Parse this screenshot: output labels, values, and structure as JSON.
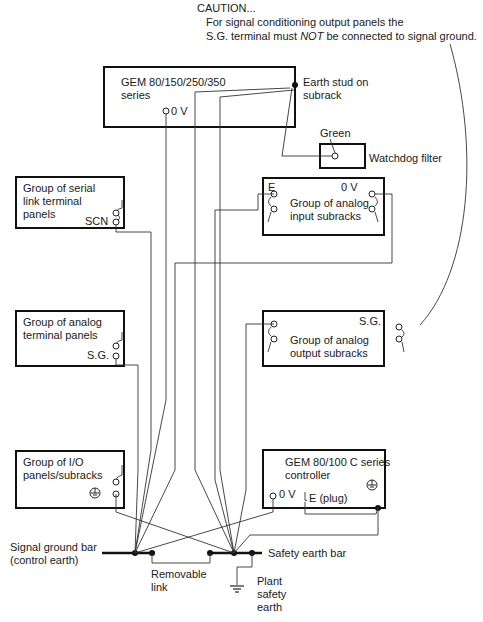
{
  "caution": {
    "title": "CAUTION...",
    "line1": "For signal conditioning output panels the",
    "line2_a": "S.G. terminal must ",
    "line2_em": "NOT",
    "line2_b": " be connected to signal ground."
  },
  "gem_series": {
    "line1": "GEM 80/150/250/350",
    "line2": "series",
    "terminal": "0 V"
  },
  "earth_stud": {
    "line1": "Earth stud on",
    "line2": "subrack"
  },
  "watchdog": {
    "green_label": "Green",
    "label": "Watchdog filter"
  },
  "serial_link": {
    "line1": "Group of serial",
    "line2": "link terminal",
    "line3": "panels",
    "terminal": "SCN"
  },
  "analog_input": {
    "line1": "Group of analog",
    "line2": "input subracks",
    "terminal_e": "E",
    "terminal_0v": "0 V"
  },
  "analog_terminal": {
    "line1": "Group of analog",
    "line2": "terminal panels",
    "terminal": "S.G."
  },
  "analog_output": {
    "line1": "Group of analog",
    "line2": "output subracks",
    "terminal": "S.G."
  },
  "io_panels": {
    "line1": "Group of I/O",
    "line2": "panels/subracks"
  },
  "controller": {
    "line1": "GEM 80/100 C series",
    "line2": "controller",
    "terminal_0v": "0 V",
    "terminal_e": "E (plug)"
  },
  "signal_ground_bar": {
    "line1": "Signal ground bar",
    "line2": "(control earth)"
  },
  "safety_earth_bar": {
    "label": "Safety earth bar"
  },
  "removable_link": {
    "line1": "Removable",
    "line2": "link"
  },
  "plant_safety_earth": {
    "line1": "Plant",
    "line2": "safety",
    "line3": "earth"
  }
}
